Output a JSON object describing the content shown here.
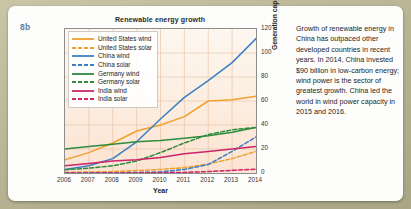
{
  "figure_number": "8b",
  "caption": "Growth of renewable energy in China has outpaced other developed countries in recent years. In 2014, China invested $90 billion in low-carbon energy; wind power is the sector of greatest growth. China led the world in wind power capacity in 2015 and 2016.",
  "chart_data": {
    "type": "line",
    "title": "Renewable energy growth",
    "xlabel": "Year",
    "ylabel": "Generation capacity (GW)",
    "x": [
      2006,
      2007,
      2008,
      2009,
      2010,
      2011,
      2012,
      2013,
      2014
    ],
    "xlim": [
      2006,
      2014
    ],
    "ylim": [
      0,
      120
    ],
    "xticks": [
      "2006",
      "2007",
      "2008",
      "2009",
      "2010",
      "2011",
      "2012",
      "2013",
      "2014"
    ],
    "yticks": [
      "0",
      "20",
      "40",
      "60",
      "80",
      "100",
      "120"
    ],
    "grid": true,
    "legend_position": "top-left-inside",
    "series": [
      {
        "name": "United States wind",
        "color": "#f0a12e",
        "style": "solid",
        "values": [
          11,
          17,
          25,
          35,
          40,
          47,
          60,
          61,
          64
        ]
      },
      {
        "name": "United States solar",
        "color": "#f0a12e",
        "style": "dashed",
        "values": [
          0.5,
          0.8,
          1.2,
          2,
          3,
          4.5,
          7.5,
          12,
          18
        ]
      },
      {
        "name": "China wind",
        "color": "#3b7fc4",
        "style": "solid",
        "values": [
          3,
          6,
          12,
          26,
          45,
          63,
          77,
          92,
          112
        ]
      },
      {
        "name": "China solar",
        "color": "#3b7fc4",
        "style": "dashed",
        "values": [
          0.1,
          0.1,
          0.2,
          0.4,
          0.9,
          3,
          7,
          18,
          30
        ]
      },
      {
        "name": "Germany wind",
        "color": "#2f8a3e",
        "style": "solid",
        "values": [
          20,
          22,
          24,
          26,
          27,
          29,
          31,
          34,
          38
        ]
      },
      {
        "name": "Germany solar",
        "color": "#2f8a3e",
        "style": "dashed",
        "values": [
          2.8,
          4,
          6,
          10,
          17,
          25,
          32,
          36,
          38
        ]
      },
      {
        "name": "India wind",
        "color": "#c9256b",
        "style": "solid",
        "values": [
          6,
          8,
          10,
          11,
          13,
          16,
          18,
          20,
          22
        ]
      },
      {
        "name": "India solar",
        "color": "#c9256b",
        "style": "dashed",
        "values": [
          0,
          0,
          0,
          0.1,
          0.2,
          0.5,
          1.2,
          2.2,
          3.2
        ]
      }
    ]
  }
}
